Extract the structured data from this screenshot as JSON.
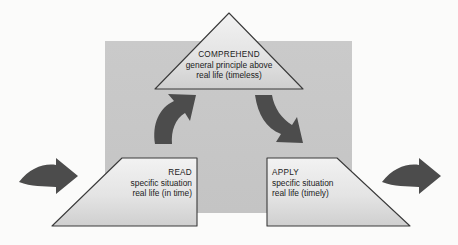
{
  "diagram": {
    "background_panel_color": "#c9c9c9",
    "shape_fill_top": "#efefef",
    "shape_fill_bottom": "#d2d2d2",
    "shape_outline_color": "#3a3a3a",
    "arrow_color": "#4a4a4a",
    "canvas_color": "#fbfbfa",
    "nodes": [
      {
        "id": "comprehend",
        "shape": "triangle",
        "title": "COMPREHEND",
        "line1": "general principle above",
        "line2": "real life (timeless)",
        "align": "center"
      },
      {
        "id": "read",
        "shape": "trapezoid-left",
        "title": "READ",
        "line1": "specific situation",
        "line2": "real life (in time)",
        "align": "right"
      },
      {
        "id": "apply",
        "shape": "trapezoid-right",
        "title": "APPLY",
        "line1": "specific situation",
        "line2": "real life (timely)",
        "align": "left"
      }
    ],
    "arrows": [
      {
        "id": "inbound-arrow",
        "direction": "right",
        "position": "outer-left"
      },
      {
        "id": "read-to-comprehend-arrow",
        "direction": "curve-up-right",
        "position": "inner-left"
      },
      {
        "id": "comprehend-to-apply-arrow",
        "direction": "curve-down-right",
        "position": "inner-right"
      },
      {
        "id": "outbound-arrow",
        "direction": "right",
        "position": "outer-right"
      }
    ]
  }
}
